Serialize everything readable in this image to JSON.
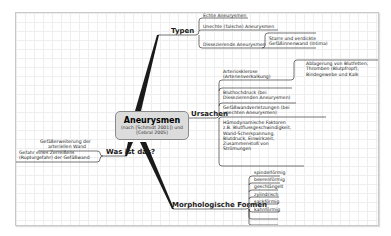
{
  "center": {
    "title": "Aneurysmen",
    "subtitle_line1": "(nach [Schmidt 2001]) und",
    "subtitle_line2": "[Cebral 2005]"
  },
  "branches": {
    "typen": {
      "label": "Typen",
      "items": [
        "Echte Aneurysmen",
        "Unechte (falsche) Aneurysmen",
        "Dissezierende Aneurysmen"
      ],
      "sub": [
        "Starre und verdickte",
        "Gefäßinnenwand (Intima)"
      ]
    },
    "ursachen": {
      "label": "Ursachen",
      "items": [
        [
          "Arteriosklerose",
          "(Arterienverkalkung)"
        ],
        [
          "Bluthochdruck (bei",
          "Dissezierenden Aneurysmen)"
        ],
        [
          "Gefäßwandverletzungen (bei",
          "unechten Aneurysmen)"
        ],
        [
          "Hämodynamische Faktoren",
          "z.B. Blutflussgeschwindigkeit,",
          "Wand-Scherspannung,",
          "Blutdruck, Einwirkzeit,",
          "Zusammenstoß von",
          "Strömungen"
        ]
      ],
      "sub": [
        "Ablagerung von Blutfetten,",
        "Thromben (Blutpfropf),",
        "Bindegewebe und Kalk"
      ]
    },
    "was": {
      "label": "Was ist das?",
      "items": [
        [
          "Gefäßerweiterung der",
          "arteriellen Wand"
        ],
        [
          "Gefahr eines Zerreißens",
          "(Rupturgefahr) der Gefäßwand"
        ]
      ]
    },
    "formen": {
      "label": "Morphologische Formen",
      "items": [
        "spindelförmig",
        "beerenförmig",
        "geschlängelt",
        "zylindrisch",
        "sackförmig",
        "kahnförmig"
      ]
    }
  },
  "colors": {
    "line": "#1a1a1a",
    "node_fill": "#dcdcdc",
    "node_border": "#8a8a8a",
    "grid": "#eeeeee"
  }
}
